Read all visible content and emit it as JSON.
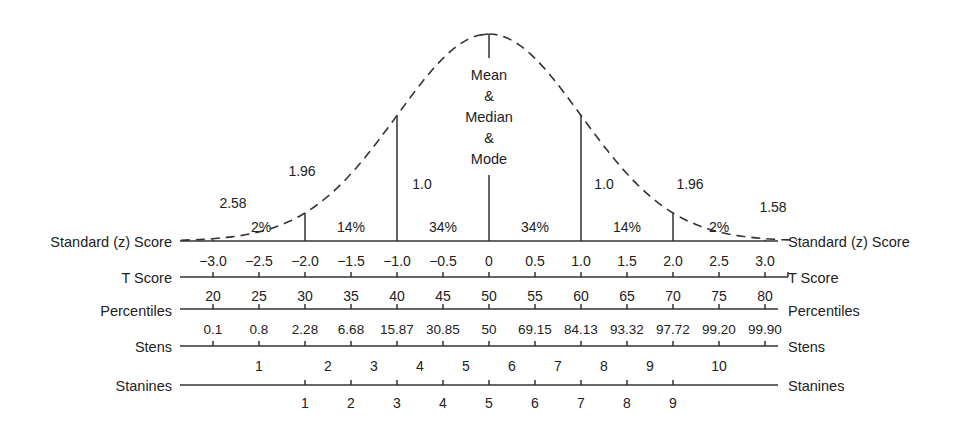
{
  "chart_data": {
    "type": "diagram",
    "curve_labels": {
      "center": [
        "Mean",
        "&",
        "Median",
        "&",
        "Mode"
      ],
      "left_sd1": "1.0",
      "right_sd1": "1.0",
      "left_196": "1.96",
      "right_196": "1.96",
      "left_258": "2.58",
      "right_258": "1.58"
    },
    "area_percents": [
      "2%",
      "14%",
      "34%",
      "34%",
      "14%",
      "2%"
    ],
    "scales": [
      {
        "name": "Standard (z) Score",
        "values": [
          "-3.0",
          "-2.5",
          "-2.0",
          "-1.5",
          "-1.0",
          "-0.5",
          "0",
          "0.5",
          "1.0",
          "1.5",
          "2.0",
          "2.5",
          "3.0"
        ]
      },
      {
        "name": "T Score",
        "values": [
          "20",
          "25",
          "30",
          "35",
          "40",
          "45",
          "50",
          "55",
          "60",
          "65",
          "70",
          "75",
          "80"
        ]
      },
      {
        "name": "Percentiles",
        "values": [
          "0.1",
          "0.8",
          "2.28",
          "6.68",
          "15.87",
          "30.85",
          "50",
          "69.15",
          "84.13",
          "93.32",
          "97.72",
          "99.20",
          "99.90"
        ]
      },
      {
        "name": "Stens",
        "values": [
          "1",
          "2",
          "3",
          "4",
          "5",
          "6",
          "7",
          "8",
          "9",
          "10"
        ]
      },
      {
        "name": "Stanines",
        "values": [
          "1",
          "2",
          "3",
          "4",
          "5",
          "6",
          "7",
          "8",
          "9"
        ]
      }
    ]
  }
}
